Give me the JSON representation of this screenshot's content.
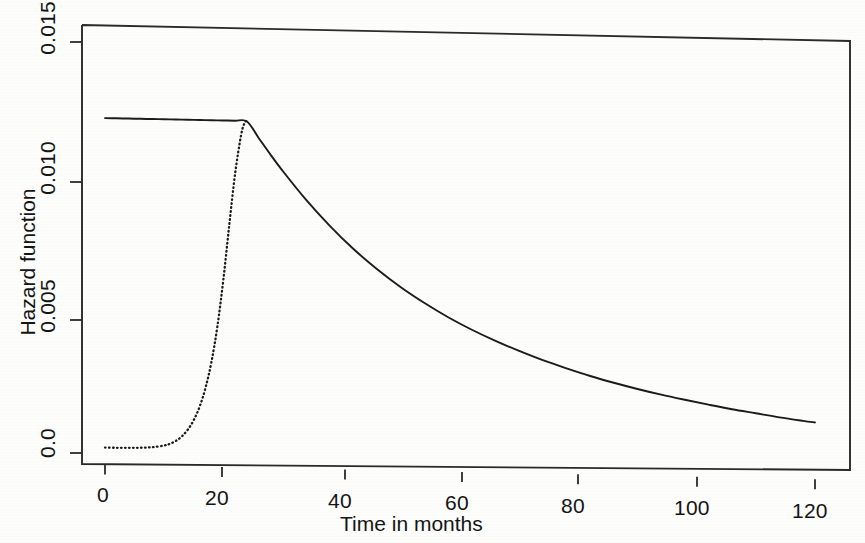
{
  "chart_data": {
    "type": "line",
    "title": "",
    "xlabel": "Time in months",
    "ylabel": "Hazard function",
    "xlim": [
      0,
      125
    ],
    "ylim": [
      0.0,
      0.0157
    ],
    "grid": false,
    "legend": "none",
    "xticks": [
      0,
      20,
      40,
      60,
      80,
      100,
      120
    ],
    "xtick_labels": [
      "0",
      "20",
      "40",
      "60",
      "80",
      "100",
      "120"
    ],
    "yticks": [
      0.0,
      0.005,
      0.01,
      0.015
    ],
    "ytick_labels": [
      "0.0",
      "0.005",
      "0.010",
      "0.015"
    ],
    "series": [
      {
        "name": "solid-hazard",
        "style": "solid",
        "color": "#1b1b1b",
        "x": [
          0,
          2,
          4,
          6,
          8,
          10,
          12,
          14,
          16,
          18,
          20,
          22,
          24,
          26,
          28,
          30,
          34,
          38,
          42,
          46,
          50,
          54,
          58,
          62,
          66,
          70,
          74,
          78,
          82,
          86,
          90,
          94,
          98,
          102,
          106,
          110,
          114,
          118,
          120
        ],
        "y": [
          0.01222,
          0.01222,
          0.01222,
          0.01222,
          0.01222,
          0.01222,
          0.01222,
          0.01222,
          0.01222,
          0.01222,
          0.01222,
          0.01222,
          0.0122,
          0.0116,
          0.011,
          0.01043,
          0.00938,
          0.00845,
          0.00762,
          0.0069,
          0.00626,
          0.0057,
          0.0052,
          0.00476,
          0.00437,
          0.00402,
          0.0037,
          0.00342,
          0.00316,
          0.00293,
          0.00272,
          0.00253,
          0.00236,
          0.0022,
          0.00205,
          0.00192,
          0.00179,
          0.00168,
          0.00163
        ]
      },
      {
        "name": "dotted-hazard",
        "style": "dotted",
        "color": "#1b1b1b",
        "x": [
          0,
          2,
          4,
          6,
          8,
          10,
          11,
          12,
          13,
          14,
          15,
          16,
          17,
          18,
          19,
          20,
          21,
          22,
          23,
          23.6,
          24,
          24.2,
          24.4
        ],
        "y": [
          0.00018,
          0.00018,
          0.00019,
          0.0002,
          0.00023,
          0.0003,
          0.00037,
          0.00048,
          0.00065,
          0.0009,
          0.00125,
          0.00175,
          0.00245,
          0.0034,
          0.0047,
          0.0064,
          0.0084,
          0.0103,
          0.0117,
          0.01215,
          0.01222,
          0.01222,
          0.01222
        ]
      }
    ]
  },
  "axes": {
    "x_title": "Time in months",
    "y_title": "Hazard function"
  }
}
